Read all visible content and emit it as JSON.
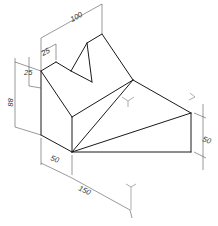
{
  "figure": {
    "header_fragment": "",
    "dimensions": {
      "top_width": "100",
      "notch_width": "25",
      "notch_depth": "25",
      "height": "88",
      "front_depth": "50",
      "length": "150",
      "right_height": "50"
    },
    "colors": {
      "line": "#1a1a1a",
      "dimension": "#555555",
      "background": "#ffffff"
    }
  }
}
